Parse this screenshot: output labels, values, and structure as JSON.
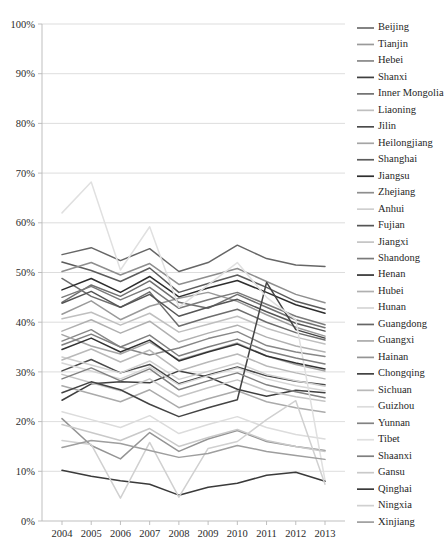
{
  "chart_data": {
    "type": "line",
    "title": "",
    "subtitle": "",
    "xlabel": "",
    "ylabel": "",
    "x": [
      2004,
      2005,
      2006,
      2007,
      2008,
      2009,
      2010,
      2011,
      2012,
      2013
    ],
    "xtick_labels": [
      "2004",
      "2005",
      "2006",
      "2007",
      "2008",
      "2009",
      "2010",
      "2011",
      "2012",
      "2013"
    ],
    "ytick_labels": [
      "0%",
      "10%",
      "20%",
      "30%",
      "40%",
      "50%",
      "60%",
      "70%",
      "80%",
      "90%",
      "100%"
    ],
    "ytick_values": [
      0,
      10,
      20,
      30,
      40,
      50,
      60,
      70,
      80,
      90,
      100
    ],
    "ylim": [
      0,
      100
    ],
    "xlim": [
      2004,
      2013
    ],
    "grid": "horizontal",
    "legend_position": "right",
    "value_unit": "percent",
    "series": [
      {
        "name": "Beijing",
        "color": "#6d6d6d",
        "values": [
          48.8,
          45.2,
          43.0,
          46.1,
          39.2,
          41.0,
          42.6,
          40.0,
          37.9,
          36.4
        ]
      },
      {
        "name": "Tianjin",
        "color": "#9a9a9a",
        "values": [
          41.6,
          44.3,
          40.5,
          43.2,
          44.8,
          46.0,
          44.2,
          41.5,
          39.0,
          37.2
        ]
      },
      {
        "name": "Hebei",
        "color": "#878787",
        "values": [
          36.2,
          38.5,
          35.0,
          33.4,
          34.8,
          36.7,
          38.1,
          35.3,
          34.0,
          33.1
        ]
      },
      {
        "name": "Shanxi",
        "color": "#3f3f3f",
        "values": [
          24.3,
          27.6,
          28.0,
          27.8,
          30.2,
          29.0,
          26.5,
          25.1,
          26.3,
          25.8
        ]
      },
      {
        "name": "Inner Mongolia",
        "color": "#707070",
        "values": [
          44.0,
          47.5,
          45.2,
          48.3,
          44.0,
          42.8,
          45.6,
          43.0,
          40.5,
          38.9
        ]
      },
      {
        "name": "Liaoning",
        "color": "#bfbfbf",
        "values": [
          40.7,
          42.0,
          39.4,
          41.8,
          38.0,
          39.6,
          41.2,
          38.8,
          37.0,
          35.6
        ]
      },
      {
        "name": "Jilin",
        "color": "#4a4a4a",
        "values": [
          30.2,
          32.5,
          29.8,
          31.5,
          27.6,
          29.4,
          31.0,
          29.2,
          28.1,
          27.4
        ]
      },
      {
        "name": "Heilongjiang",
        "color": "#a5a5a5",
        "values": [
          37.5,
          35.2,
          33.6,
          36.0,
          32.4,
          34.1,
          35.8,
          33.2,
          31.5,
          30.2
        ]
      },
      {
        "name": "Shanghai",
        "color": "#5c5c5c",
        "values": [
          52.1,
          50.4,
          48.2,
          50.9,
          46.0,
          47.8,
          49.5,
          47.0,
          44.2,
          42.6
        ]
      },
      {
        "name": "Jiangsu",
        "color": "#2e2e2e",
        "values": [
          46.5,
          48.8,
          46.0,
          49.2,
          45.1,
          46.9,
          48.4,
          46.0,
          43.5,
          41.8
        ]
      },
      {
        "name": "Zhejiang",
        "color": "#8e8e8e",
        "values": [
          50.2,
          52.0,
          49.5,
          51.8,
          47.6,
          49.2,
          50.8,
          48.2,
          45.6,
          43.9
        ]
      },
      {
        "name": "Anhui",
        "color": "#cfcfcf",
        "values": [
          33.0,
          31.4,
          29.8,
          32.2,
          28.5,
          30.1,
          31.8,
          29.5,
          28.2,
          27.1
        ]
      },
      {
        "name": "Fujian",
        "color": "#555555",
        "values": [
          43.8,
          46.2,
          43.0,
          45.6,
          41.2,
          43.0,
          44.6,
          42.1,
          39.8,
          38.2
        ]
      },
      {
        "name": "Jiangxi",
        "color": "#c4c4c4",
        "values": [
          29.5,
          27.8,
          26.2,
          28.6,
          25.0,
          26.8,
          28.4,
          26.2,
          25.0,
          24.1
        ]
      },
      {
        "name": "Shandong",
        "color": "#7a7a7a",
        "values": [
          45.0,
          47.2,
          44.5,
          47.0,
          42.8,
          44.5,
          46.0,
          43.6,
          41.2,
          39.5
        ]
      },
      {
        "name": "Henan",
        "color": "#333333",
        "values": [
          34.5,
          36.8,
          34.0,
          36.4,
          32.2,
          34.0,
          35.6,
          33.2,
          31.8,
          30.6
        ]
      },
      {
        "name": "Hubei",
        "color": "#b0b0b0",
        "values": [
          38.2,
          40.5,
          37.8,
          40.2,
          36.0,
          37.8,
          39.4,
          37.0,
          35.2,
          34.0
        ]
      },
      {
        "name": "Hunan",
        "color": "#d6d6d6",
        "values": [
          31.8,
          30.2,
          28.6,
          31.0,
          27.4,
          29.2,
          30.8,
          28.6,
          27.2,
          26.2
        ]
      },
      {
        "name": "Guangdong",
        "color": "#666666",
        "values": [
          53.6,
          55.0,
          52.4,
          54.8,
          50.2,
          52.0,
          55.5,
          52.8,
          51.5,
          51.2
        ]
      },
      {
        "name": "Guangxi",
        "color": "#aaaaaa",
        "values": [
          27.2,
          25.6,
          24.0,
          26.4,
          22.8,
          24.6,
          26.2,
          24.0,
          22.8,
          21.9
        ]
      },
      {
        "name": "Hainan",
        "color": "#949494",
        "values": [
          20.6,
          15.2,
          12.5,
          17.8,
          14.0,
          16.5,
          18.2,
          16.0,
          15.0,
          14.2
        ]
      },
      {
        "name": "Chongqing",
        "color": "#444444",
        "values": [
          25.8,
          28.0,
          26.4,
          23.5,
          21.0,
          22.8,
          24.4,
          48.0,
          38.5,
          36.8
        ]
      },
      {
        "name": "Sichuan",
        "color": "#b9b9b9",
        "values": [
          32.4,
          34.6,
          32.0,
          34.4,
          30.2,
          32.0,
          33.6,
          31.2,
          29.8,
          28.6
        ]
      },
      {
        "name": "Guizhou",
        "color": "#dcdcdc",
        "values": [
          22.0,
          20.4,
          18.8,
          21.2,
          17.6,
          19.4,
          21.0,
          18.8,
          17.4,
          16.5
        ]
      },
      {
        "name": "Yunnan",
        "color": "#828282",
        "values": [
          28.6,
          30.8,
          28.2,
          30.6,
          26.4,
          28.2,
          29.8,
          27.4,
          26.0,
          24.8
        ]
      },
      {
        "name": "Tibet",
        "color": "#e0e0e0",
        "values": [
          62.0,
          68.2,
          50.5,
          59.2,
          43.0,
          47.5,
          52.0,
          45.0,
          40.5,
          8.2
        ]
      },
      {
        "name": "Shaanxi",
        "color": "#7f7f7f",
        "values": [
          35.4,
          37.6,
          35.0,
          37.4,
          33.2,
          35.0,
          36.6,
          34.2,
          32.8,
          31.6
        ]
      },
      {
        "name": "Gansu",
        "color": "#c9c9c9",
        "values": [
          19.4,
          17.8,
          16.2,
          18.6,
          15.0,
          16.8,
          18.4,
          16.2,
          15.0,
          14.0
        ]
      },
      {
        "name": "Qinghai",
        "color": "#3a3a3a",
        "values": [
          10.2,
          9.0,
          8.1,
          7.4,
          5.2,
          6.8,
          7.6,
          9.2,
          9.8,
          8.0
        ]
      },
      {
        "name": "Ningxia",
        "color": "#d0d0d0",
        "values": [
          16.2,
          15.4,
          4.6,
          15.8,
          4.8,
          14.6,
          16.0,
          20.4,
          24.2,
          7.4
        ]
      },
      {
        "name": "Xinjiang",
        "color": "#9e9e9e",
        "values": [
          14.8,
          16.2,
          15.6,
          14.2,
          12.8,
          13.6,
          15.2,
          14.0,
          13.2,
          12.4
        ]
      }
    ]
  }
}
